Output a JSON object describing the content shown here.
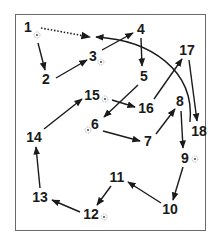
{
  "diagram": {
    "type": "numbered-path-sequence",
    "colors": {
      "stroke": "#1a1a1a",
      "frame": "#6a6a6a",
      "background": "#ffffff"
    },
    "nodes": [
      {
        "id": "1",
        "label": "1",
        "x": 28,
        "y": 27,
        "marker": true,
        "mx": 37,
        "my": 35
      },
      {
        "id": "2",
        "label": "2",
        "x": 46,
        "y": 79,
        "marker": false
      },
      {
        "id": "3",
        "label": "3",
        "x": 93,
        "y": 56,
        "marker": true,
        "mx": 101,
        "my": 62
      },
      {
        "id": "4",
        "label": "4",
        "x": 141,
        "y": 29,
        "marker": false
      },
      {
        "id": "5",
        "label": "5",
        "x": 144,
        "y": 76,
        "marker": false
      },
      {
        "id": "6",
        "label": "6",
        "x": 95,
        "y": 124,
        "marker": true,
        "mx": 88,
        "my": 130
      },
      {
        "id": "7",
        "label": "7",
        "x": 148,
        "y": 141,
        "marker": false
      },
      {
        "id": "8",
        "label": "8",
        "x": 180,
        "y": 101,
        "marker": false
      },
      {
        "id": "9",
        "label": "9",
        "x": 185,
        "y": 158,
        "marker": true,
        "mx": 195,
        "my": 159
      },
      {
        "id": "10",
        "label": "10",
        "x": 170,
        "y": 209,
        "marker": false
      },
      {
        "id": "11",
        "label": "11",
        "x": 117,
        "y": 177,
        "marker": false
      },
      {
        "id": "12",
        "label": "12",
        "x": 91,
        "y": 214,
        "marker": true,
        "mx": 104,
        "my": 217
      },
      {
        "id": "13",
        "label": "13",
        "x": 40,
        "y": 197,
        "marker": false
      },
      {
        "id": "14",
        "label": "14",
        "x": 34,
        "y": 137,
        "marker": false
      },
      {
        "id": "15",
        "label": "15",
        "x": 92,
        "y": 95,
        "marker": true,
        "mx": 105,
        "my": 99
      },
      {
        "id": "16",
        "label": "16",
        "x": 146,
        "y": 108,
        "marker": false
      },
      {
        "id": "17",
        "label": "17",
        "x": 187,
        "y": 50,
        "marker": false
      },
      {
        "id": "18",
        "label": "18",
        "x": 199,
        "y": 131,
        "marker": false
      }
    ],
    "edges": [
      {
        "from": "1",
        "to": "2",
        "style": "solid",
        "x1": 38,
        "y1": 43,
        "x2": 45,
        "y2": 70
      },
      {
        "from": "2",
        "to": "3",
        "style": "solid",
        "x1": 56,
        "y1": 78,
        "x2": 87,
        "y2": 60
      },
      {
        "from": "3",
        "to": "4",
        "style": "solid",
        "x1": 102,
        "y1": 50,
        "x2": 133,
        "y2": 33
      },
      {
        "from": "4",
        "to": "5",
        "style": "solid",
        "x1": 141,
        "y1": 38,
        "x2": 142,
        "y2": 66
      },
      {
        "from": "5",
        "to": "6",
        "style": "solid",
        "x1": 138,
        "y1": 85,
        "x2": 104,
        "y2": 117
      },
      {
        "from": "6",
        "to": "7",
        "style": "solid",
        "x1": 103,
        "y1": 131,
        "x2": 140,
        "y2": 141
      },
      {
        "from": "7",
        "to": "8",
        "style": "solid",
        "x1": 156,
        "y1": 134,
        "x2": 175,
        "y2": 109
      },
      {
        "from": "8",
        "to": "9",
        "style": "solid",
        "x1": 181,
        "y1": 111,
        "x2": 183,
        "y2": 148
      },
      {
        "from": "9",
        "to": "10",
        "style": "solid",
        "x1": 183,
        "y1": 167,
        "x2": 173,
        "y2": 200
      },
      {
        "from": "10",
        "to": "11",
        "style": "solid",
        "x1": 161,
        "y1": 203,
        "x2": 128,
        "y2": 182
      },
      {
        "from": "11",
        "to": "12",
        "style": "solid",
        "x1": 111,
        "y1": 186,
        "x2": 97,
        "y2": 205
      },
      {
        "from": "12",
        "to": "13",
        "style": "solid",
        "x1": 80,
        "y1": 212,
        "x2": 52,
        "y2": 200
      },
      {
        "from": "13",
        "to": "14",
        "style": "solid",
        "x1": 40,
        "y1": 188,
        "x2": 36,
        "y2": 147
      },
      {
        "from": "14",
        "to": "15",
        "style": "solid",
        "x1": 44,
        "y1": 129,
        "x2": 82,
        "y2": 99
      },
      {
        "from": "15",
        "to": "16",
        "style": "solid",
        "x1": 112,
        "y1": 100,
        "x2": 135,
        "y2": 107
      },
      {
        "from": "16",
        "to": "17",
        "style": "solid",
        "x1": 154,
        "y1": 99,
        "x2": 182,
        "y2": 59
      },
      {
        "from": "17",
        "to": "18",
        "style": "solid",
        "x1": 189,
        "y1": 60,
        "x2": 197,
        "y2": 121
      },
      {
        "from": "18",
        "to": "3-4 gap",
        "style": "curve",
        "path": "M 190 122 C 195 70, 150 40, 96 37"
      },
      {
        "from": "1",
        "to": "3-4 gap",
        "style": "dotted",
        "x1": 41,
        "y1": 28,
        "x2": 90,
        "y2": 37
      }
    ]
  }
}
